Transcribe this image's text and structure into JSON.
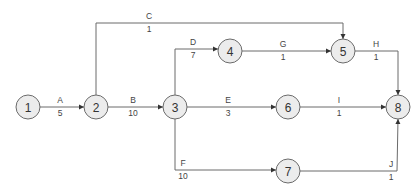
{
  "diagram": {
    "type": "activity-on-arrow network",
    "nodes": [
      {
        "id": "1",
        "label": "1"
      },
      {
        "id": "2",
        "label": "2"
      },
      {
        "id": "3",
        "label": "3"
      },
      {
        "id": "4",
        "label": "4"
      },
      {
        "id": "5",
        "label": "5"
      },
      {
        "id": "6",
        "label": "6"
      },
      {
        "id": "7",
        "label": "7"
      },
      {
        "id": "8",
        "label": "8"
      }
    ],
    "activities": [
      {
        "name": "A",
        "duration": "5",
        "from": "1",
        "to": "2"
      },
      {
        "name": "B",
        "duration": "10",
        "from": "2",
        "to": "3"
      },
      {
        "name": "C",
        "duration": "1",
        "from": "2",
        "to": "5"
      },
      {
        "name": "D",
        "duration": "7",
        "from": "3",
        "to": "4"
      },
      {
        "name": "E",
        "duration": "3",
        "from": "3",
        "to": "6"
      },
      {
        "name": "F",
        "duration": "10",
        "from": "3",
        "to": "7"
      },
      {
        "name": "G",
        "duration": "1",
        "from": "4",
        "to": "5"
      },
      {
        "name": "H",
        "duration": "1",
        "from": "5",
        "to": "8"
      },
      {
        "name": "I",
        "duration": "1",
        "from": "6",
        "to": "8"
      },
      {
        "name": "J",
        "duration": "1",
        "from": "7",
        "to": "8"
      }
    ],
    "colors": {
      "node_fill": "#ececec",
      "line": "#6b6b6b",
      "text": "#333333"
    }
  }
}
